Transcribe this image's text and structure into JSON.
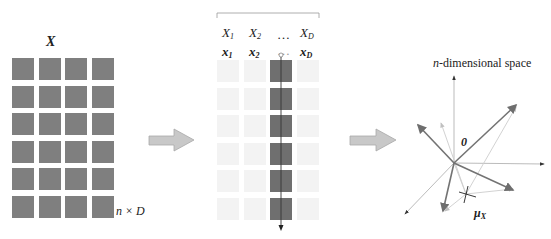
{
  "panels": {
    "matrix": {
      "title": "X",
      "dimension_label": "n × D",
      "rows": 6,
      "cols": 4,
      "cell_color": "#7f7f7f"
    },
    "columns": {
      "header_random_vars": [
        "X",
        "X",
        "…",
        "X"
      ],
      "header_random_vars_sub": [
        "1",
        "2",
        "",
        "D"
      ],
      "header_vectors": [
        "x",
        "x",
        "…",
        "x"
      ],
      "header_vectors_sub": [
        "1",
        "2",
        "",
        "D"
      ],
      "rows": 6,
      "cols": 4,
      "highlighted_col": 2,
      "highlight_color": "#6f6f6f",
      "faint_color": "#f3f3f3"
    },
    "space": {
      "title": "n-dimensional space",
      "title_italic_part": "n",
      "title_rest": "-dimensional space",
      "origin_label": "0",
      "mean_label": "μ",
      "mean_label_sub": "X"
    }
  },
  "arrows": [
    {
      "name": "arrow-matrix-to-columns"
    },
    {
      "name": "arrow-columns-to-space"
    }
  ],
  "colors": {
    "block_arrow": "#c8c8c8",
    "block_arrow_border": "#a8a8a8",
    "vector_dark": "#7a7a7a",
    "axis": "#999999",
    "axis_light": "#cfcfcf"
  }
}
